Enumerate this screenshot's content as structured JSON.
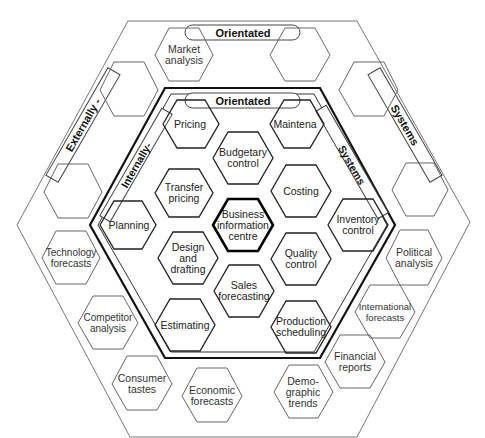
{
  "diagram": {
    "outer_bands": {
      "top": "Orientated",
      "left": "Externally -",
      "right": "Systems"
    },
    "inner_bands": {
      "top": "Orientated",
      "left": "Internally-",
      "right": "Systems"
    },
    "center": "Business information centre",
    "inner_hexes": [
      {
        "id": "pricing",
        "label": "Pricing"
      },
      {
        "id": "maintenance",
        "label": "Maintena"
      },
      {
        "id": "budgetary",
        "label": "Budgetary control"
      },
      {
        "id": "transfer",
        "label": "Transfer pricing"
      },
      {
        "id": "costing",
        "label": "Costing"
      },
      {
        "id": "planning",
        "label": "Planning"
      },
      {
        "id": "inventory",
        "label": "Inventory control"
      },
      {
        "id": "design",
        "label": "Design and drafting"
      },
      {
        "id": "quality",
        "label": "Quality control"
      },
      {
        "id": "sales",
        "label": "Sales forecasting"
      },
      {
        "id": "estimating",
        "label": "Estimating"
      },
      {
        "id": "production",
        "label": "Production scheduling"
      }
    ],
    "outer_hexes": [
      {
        "id": "market",
        "label": "Market analysis"
      },
      {
        "id": "technology",
        "label": "Technology forecasts"
      },
      {
        "id": "competitor",
        "label": "Competitor analysis"
      },
      {
        "id": "consumer",
        "label": "Consumer tastes"
      },
      {
        "id": "economic",
        "label": "Economic forecasts"
      },
      {
        "id": "demographic",
        "label": "Demo- graphic trends"
      },
      {
        "id": "financial",
        "label": "Financial reports"
      },
      {
        "id": "international",
        "label": "International forecasts"
      },
      {
        "id": "political",
        "label": "Political analysis"
      }
    ]
  }
}
